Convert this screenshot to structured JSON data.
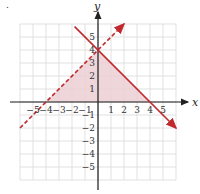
{
  "chart_data": {
    "type": "line",
    "title": "",
    "xlabel": "x",
    "ylabel": "y",
    "xlim": [
      -6,
      6
    ],
    "ylim": [
      -6,
      6
    ],
    "grid": true,
    "x_ticks": [
      "-5",
      "-4",
      "-3",
      "-2",
      "-1",
      "1",
      "2",
      "3",
      "4",
      "5"
    ],
    "y_ticks": [
      "5",
      "4",
      "3",
      "2",
      "1",
      "-1",
      "-2",
      "-3",
      "-4",
      "-5"
    ],
    "series": [
      {
        "name": "solid boundary",
        "equation": "y = -x + 4",
        "style": "solid",
        "color": "#c0282d",
        "points": [
          [
            -1.8,
            5.8
          ],
          [
            0,
            4
          ],
          [
            4,
            0
          ],
          [
            6,
            -2
          ]
        ]
      },
      {
        "name": "dashed boundary",
        "equation": "y = x + 4",
        "style": "dashed",
        "color": "#c0282d",
        "points": [
          [
            -6,
            -2
          ],
          [
            -4,
            0
          ],
          [
            0,
            4
          ],
          [
            2,
            6
          ]
        ]
      }
    ],
    "shaded_region": {
      "vertices": [
        [
          -4,
          0
        ],
        [
          0,
          4
        ],
        [
          4,
          0
        ]
      ],
      "color": "#e8c8cc"
    }
  },
  "labels": {
    "x_axis": "x",
    "y_axis": "y",
    "figure_marker": "."
  }
}
